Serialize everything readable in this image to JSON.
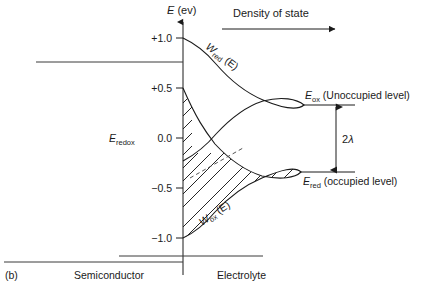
{
  "figure": {
    "caption_label": "(b)",
    "header": {
      "text": "Density of state",
      "arrow_icon": "arrow-right-icon"
    },
    "y_axis": {
      "title_symbol": "E",
      "title_unit": " (ev)",
      "arrow_icon": "arrow-up-icon",
      "ticks": [
        {
          "label": "+1.0",
          "value": 1.0
        },
        {
          "label": "+0.5",
          "value": 0.5
        },
        {
          "label": "0.0",
          "value": 0.0
        },
        {
          "label": "−0.5",
          "value": -0.5
        },
        {
          "label": "−1.0",
          "value": -1.0
        }
      ],
      "range": [
        -1.2,
        1.2
      ]
    },
    "regions": {
      "left_label": "Semiconductor",
      "right_label": "Electrolyte"
    },
    "band_edges": {
      "conduction_band_value": 0.62,
      "valence_band_value": -1.25
    },
    "levels": {
      "redox": {
        "symbol": "E",
        "subscript": "redox",
        "value": 0.0
      },
      "ox": {
        "symbol": "E",
        "subscript": "ox",
        "annotation": "(Unoccupied level)",
        "value": 0.35
      },
      "red": {
        "symbol": "E",
        "subscript": "red",
        "annotation": "(occupied level)",
        "value": -0.33
      }
    },
    "reorganization": {
      "label_prefix": "2",
      "label_symbol": "λ",
      "arrow_icon": "double-arrow-vertical-icon"
    },
    "curves": [
      {
        "name": "w-red",
        "symbol": "W",
        "subscript": "red",
        "argument": " (E)",
        "center_value": 0.35,
        "filled": false
      },
      {
        "name": "w-ox",
        "symbol": "W",
        "subscript": "ox",
        "argument": " (E)",
        "center_value": -0.33,
        "filled": true
      }
    ],
    "colors": {
      "ink": "#1a1a1a",
      "band": "#3a3a3a",
      "dashed": "#555555",
      "background": "#ffffff"
    }
  }
}
